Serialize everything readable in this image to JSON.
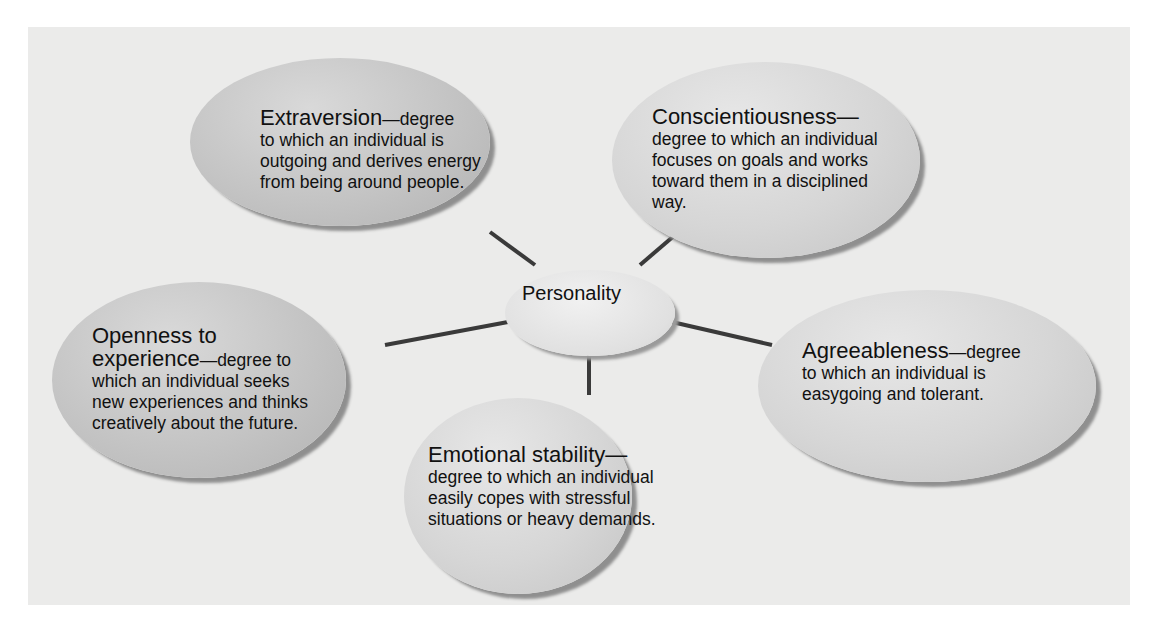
{
  "diagram": {
    "center": {
      "label": "Personality"
    },
    "traits": [
      {
        "id": "extraversion",
        "term": "Extraversion",
        "definition": "—degree\nto which an individual is\noutgoing and derives energy\nfrom being around people."
      },
      {
        "id": "conscientiousness",
        "term": "Conscientiousness—",
        "definition": "\ndegree to which an individual\nfocuses on goals and works\ntoward them in a disciplined\nway."
      },
      {
        "id": "openness",
        "term": "Openness to\nexperience",
        "definition": "—degree to\nwhich an individual seeks\nnew experiences and thinks\ncreatively about the future."
      },
      {
        "id": "agreeableness",
        "term": "Agreeableness",
        "definition": "—degree\nto which an individual is\neasygoing and tolerant."
      },
      {
        "id": "emotional-stability",
        "term": "Emotional stability—",
        "definition": "\ndegree to which an individual\neasily copes with stressful\nsituations or heavy demands."
      }
    ],
    "colors": {
      "background": "#ebebea",
      "oval": "#c4c4c4",
      "connector": "#3a3a3a"
    }
  }
}
